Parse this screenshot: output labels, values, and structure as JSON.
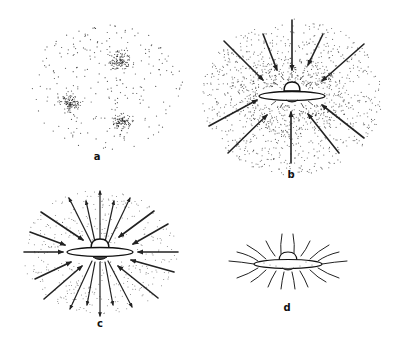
{
  "figure": {
    "panels": [
      {
        "id": "a",
        "label": "a",
        "description": "diffuse cloud of dots with three denser condensations",
        "label_pos": [
          97,
          151
        ]
      },
      {
        "id": "b",
        "label": "b",
        "description": "cloud with inward arrows converging onto central disc with bulge",
        "label_pos": [
          291,
          169
        ]
      },
      {
        "id": "c",
        "label": "c",
        "description": "disc with bulge, outward and inward arrows in thinning cloud",
        "label_pos": [
          100,
          318
        ]
      },
      {
        "id": "d",
        "label": "d",
        "description": "thin disc with bulge and wavy radial lines, no cloud",
        "label_pos": [
          287,
          302
        ]
      }
    ]
  }
}
